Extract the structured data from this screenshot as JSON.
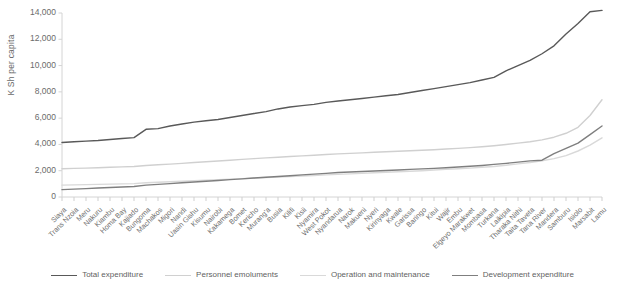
{
  "chart_data": {
    "type": "line",
    "title": "",
    "subtitle": "",
    "xlabel": "",
    "ylabel": "K Sh per capita",
    "ylim": [
      0,
      14000
    ],
    "yticks": [
      0,
      2000,
      4000,
      6000,
      8000,
      10000,
      12000,
      14000
    ],
    "ytick_labels": [
      "0",
      "2,000",
      "4,000",
      "6,000",
      "8,000",
      "10,000",
      "12,000",
      "14,000"
    ],
    "grid": false,
    "legend_position": "bottom",
    "categories": [
      "Siaya",
      "Trans Nzoia",
      "Meru",
      "Nakuru",
      "Kiambu",
      "Homa Bay",
      "Kajiado",
      "Bungoma",
      "Machakos",
      "Migori",
      "Nandi",
      "Uasin Gishu",
      "Kisumu",
      "Nairobi",
      "Kakamega",
      "Bomet",
      "Kericho",
      "Murang'a",
      "Busia",
      "Kilifi",
      "Kisii",
      "Nyamira",
      "West Pokot",
      "Nyandarua",
      "Narok",
      "Makueni",
      "Nyeri",
      "Kirinyaga",
      "Kwale",
      "Garissa",
      "Baringo",
      "Kitui",
      "Wajir",
      "Embu",
      "Elgeyo Marakwet",
      "Mombasa",
      "Turkana",
      "Laikipia",
      "Tharaka Nithi",
      "Taita Taveta",
      "Tana River",
      "Mandera",
      "Samburu",
      "Isiolo",
      "Marsabit",
      "Lamu"
    ],
    "series": [
      {
        "name": "Total expenditure",
        "color": "#595959",
        "values": [
          4150,
          4200,
          4250,
          4300,
          4380,
          4450,
          4520,
          5150,
          5200,
          5400,
          5550,
          5700,
          5800,
          5900,
          6050,
          6200,
          6350,
          6500,
          6700,
          6850,
          6950,
          7050,
          7200,
          7300,
          7400,
          7500,
          7600,
          7700,
          7800,
          7950,
          8100,
          8250,
          8400,
          8550,
          8700,
          8900,
          9100,
          9600,
          10000,
          10400,
          10900,
          11500,
          12400,
          13200,
          14100,
          14200
        ]
      },
      {
        "name": "Personnel emoluments",
        "color": "#d0d0d0",
        "values": [
          2150,
          2180,
          2200,
          2230,
          2260,
          2290,
          2320,
          2400,
          2450,
          2500,
          2560,
          2620,
          2680,
          2740,
          2800,
          2860,
          2920,
          2980,
          3030,
          3080,
          3130,
          3180,
          3230,
          3280,
          3320,
          3360,
          3400,
          3440,
          3480,
          3520,
          3560,
          3600,
          3650,
          3700,
          3760,
          3820,
          3900,
          4000,
          4100,
          4200,
          4350,
          4550,
          4850,
          5300,
          6200,
          7400
        ]
      },
      {
        "name": "Operation and maintenance",
        "color": "#d9d9d9",
        "values": [
          900,
          920,
          940,
          960,
          980,
          1000,
          1020,
          1080,
          1120,
          1160,
          1200,
          1240,
          1280,
          1320,
          1360,
          1400,
          1440,
          1480,
          1520,
          1560,
          1600,
          1640,
          1680,
          1720,
          1760,
          1800,
          1840,
          1880,
          1920,
          1960,
          2000,
          2050,
          2100,
          2150,
          2200,
          2260,
          2320,
          2420,
          2520,
          2620,
          2760,
          2920,
          3150,
          3500,
          3950,
          4500
        ]
      },
      {
        "name": "Development expenditure",
        "color": "#7f7f7f",
        "values": [
          560,
          600,
          640,
          680,
          720,
          760,
          800,
          900,
          960,
          1020,
          1080,
          1140,
          1200,
          1260,
          1320,
          1380,
          1440,
          1500,
          1560,
          1620,
          1680,
          1740,
          1800,
          1860,
          1900,
          1940,
          1980,
          2020,
          2060,
          2100,
          2140,
          2180,
          2230,
          2280,
          2340,
          2400,
          2480,
          2560,
          2650,
          2750,
          2800,
          3300,
          3700,
          4100,
          4750,
          5400
        ]
      }
    ]
  },
  "legend": {
    "items": [
      {
        "label": "Total expenditure",
        "color": "#595959"
      },
      {
        "label": "Personnel emoluments",
        "color": "#d0d0d0"
      },
      {
        "label": "Operation and maintenance",
        "color": "#d9d9d9"
      },
      {
        "label": "Development expenditure",
        "color": "#7f7f7f"
      }
    ]
  },
  "axis": {
    "y_title": "K Sh per capita"
  }
}
